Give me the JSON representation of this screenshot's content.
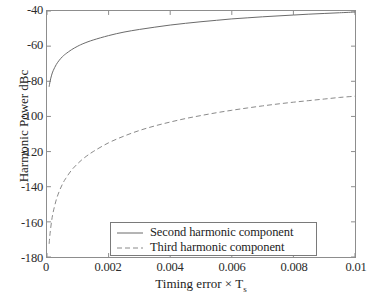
{
  "chart_data": {
    "type": "line",
    "title": "",
    "xlabel": "Timing error  × T",
    "xlabel_subscript": "s",
    "ylabel": "Harmonic Power dBc",
    "xlim": [
      0,
      0.01
    ],
    "ylim": [
      -180,
      -40
    ],
    "xticks": [
      0,
      0.002,
      0.004,
      0.006,
      0.008,
      0.01
    ],
    "xtick_labels": [
      "0",
      "0.002",
      "0.004",
      "0.006",
      "0.008",
      "0.01"
    ],
    "yticks": [
      -40,
      -60,
      -80,
      -100,
      -120,
      -140,
      -160,
      -180
    ],
    "ytick_labels": [
      "-40",
      "-60",
      "-80",
      "-100",
      "-120",
      "-140",
      "-160",
      "-180"
    ],
    "grid": false,
    "legend_position": "lower center",
    "line_color": "#6b6b6b",
    "frame_color": "#8d8d8d",
    "series": [
      {
        "name": "Second harmonic component",
        "style": "solid",
        "x": [
          7e-05,
          0.0001,
          0.00015,
          0.0002,
          0.0003,
          0.0004,
          0.0005,
          0.0006,
          0.0008,
          0.001,
          0.0012,
          0.0015,
          0.002,
          0.0025,
          0.003,
          0.0035,
          0.004,
          0.0045,
          0.005,
          0.0055,
          0.006,
          0.0065,
          0.007,
          0.0075,
          0.008,
          0.0085,
          0.009,
          0.0095,
          0.01
        ],
        "y": [
          -83.1,
          -80.0,
          -76.5,
          -74.0,
          -70.5,
          -68.0,
          -66.0,
          -64.5,
          -62.0,
          -60.0,
          -58.4,
          -56.5,
          -54.0,
          -52.0,
          -50.5,
          -49.2,
          -48.0,
          -47.0,
          -46.1,
          -45.3,
          -44.5,
          -43.9,
          -43.3,
          -42.8,
          -42.3,
          -41.8,
          -41.4,
          -41.0,
          -40.6
        ]
      },
      {
        "name": "Third harmonic component",
        "style": "dashed",
        "x": [
          7e-05,
          0.0001,
          0.00015,
          0.0002,
          0.0003,
          0.0004,
          0.0005,
          0.0006,
          0.0008,
          0.001,
          0.0012,
          0.0015,
          0.002,
          0.0025,
          0.003,
          0.0035,
          0.004,
          0.0045,
          0.005,
          0.0055,
          0.006,
          0.0065,
          0.007,
          0.0075,
          0.008,
          0.0085,
          0.009,
          0.0095,
          0.01
        ],
        "y": [
          -172.5,
          -166.5,
          -159.5,
          -154.5,
          -147.5,
          -142.5,
          -138.6,
          -135.5,
          -130.5,
          -126.8,
          -123.7,
          -120.0,
          -115.0,
          -111.2,
          -108.0,
          -105.4,
          -103.2,
          -101.2,
          -99.5,
          -97.9,
          -96.5,
          -95.2,
          -94.0,
          -92.9,
          -91.9,
          -91.0,
          -90.1,
          -89.2,
          -88.5
        ]
      }
    ],
    "legend": [
      {
        "label": "Second harmonic component",
        "style": "solid"
      },
      {
        "label": "Third harmonic component",
        "style": "dashed"
      }
    ]
  }
}
